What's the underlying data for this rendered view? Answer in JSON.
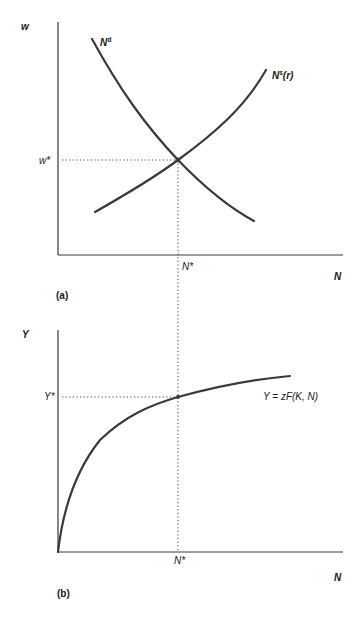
{
  "figure": {
    "panel_a": {
      "label": "(a)",
      "y_axis_label": "w",
      "x_axis_label": "N",
      "equilibrium_y_label": "w*",
      "equilibrium_x_label": "N*",
      "demand_curve": {
        "base": "N",
        "sup": "d"
      },
      "supply_curve": {
        "base": "N",
        "sup": "s",
        "suffix": "(r)"
      }
    },
    "panel_b": {
      "label": "(b)",
      "y_axis_label": "Y",
      "x_axis_label": "N",
      "equilibrium_y_label": "Y*",
      "equilibrium_x_label": "N*",
      "production_function_label": "Y = zF(K, N)"
    },
    "colors": {
      "line": "#3a3a3a",
      "text": "#1a1a1a",
      "background": "#ffffff"
    }
  }
}
